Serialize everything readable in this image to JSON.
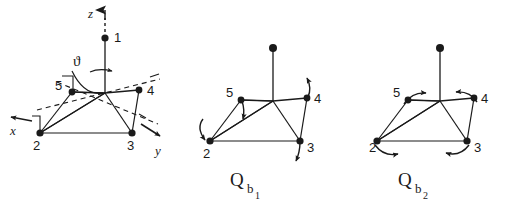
{
  "figure": {
    "background_color": "#ffffff",
    "stroke_color": "#1a1a1a",
    "panel_count": 3
  },
  "axes": {
    "z": {
      "label": "z",
      "direction": "up",
      "dashed": true
    },
    "x": {
      "label": "x",
      "direction": "left-up",
      "dashed": true
    },
    "y": {
      "label": "y",
      "direction": "right-down",
      "dashed": true
    },
    "angle": {
      "label": "ϑ",
      "name": "theta"
    }
  },
  "vertices": {
    "apex": {
      "label": "1"
    },
    "equatorial": [
      {
        "label": "2"
      },
      {
        "label": "3"
      },
      {
        "label": "4"
      },
      {
        "label": "5"
      }
    ]
  },
  "panels": [
    {
      "id": "reference",
      "name": "coordinate-reference-structure",
      "mode_label": "",
      "mode_sub": "",
      "mode_sub2": "",
      "shows_axes": true,
      "shows_arrows": false,
      "vertex_labels": [
        "1",
        "2",
        "3",
        "4",
        "5"
      ]
    },
    {
      "id": "qb1",
      "name": "mode-qb1",
      "mode_label": "Q",
      "mode_sub": "b",
      "mode_sub2": "1",
      "shows_axes": false,
      "shows_arrows": true,
      "vertex_labels": [
        "2",
        "3",
        "4",
        "5"
      ],
      "arrows": [
        {
          "at": "5",
          "style": "curved",
          "direction": "down"
        },
        {
          "at": "2",
          "style": "curved",
          "direction": "down-left"
        },
        {
          "at": "3",
          "style": "curved",
          "direction": "down-right"
        },
        {
          "at": "4",
          "style": "curved",
          "direction": "up-right"
        }
      ]
    },
    {
      "id": "qb2",
      "name": "mode-qb2",
      "mode_label": "Q",
      "mode_sub": "b",
      "mode_sub2": "2",
      "shows_axes": false,
      "shows_arrows": true,
      "vertex_labels": [
        "2",
        "3",
        "4",
        "5"
      ],
      "arrows": [
        {
          "at": "5",
          "style": "curved",
          "direction": "right"
        },
        {
          "at": "4",
          "style": "curved",
          "direction": "left"
        },
        {
          "at": "2",
          "style": "curved",
          "direction": "right"
        },
        {
          "at": "3",
          "style": "curved",
          "direction": "left"
        }
      ]
    }
  ]
}
